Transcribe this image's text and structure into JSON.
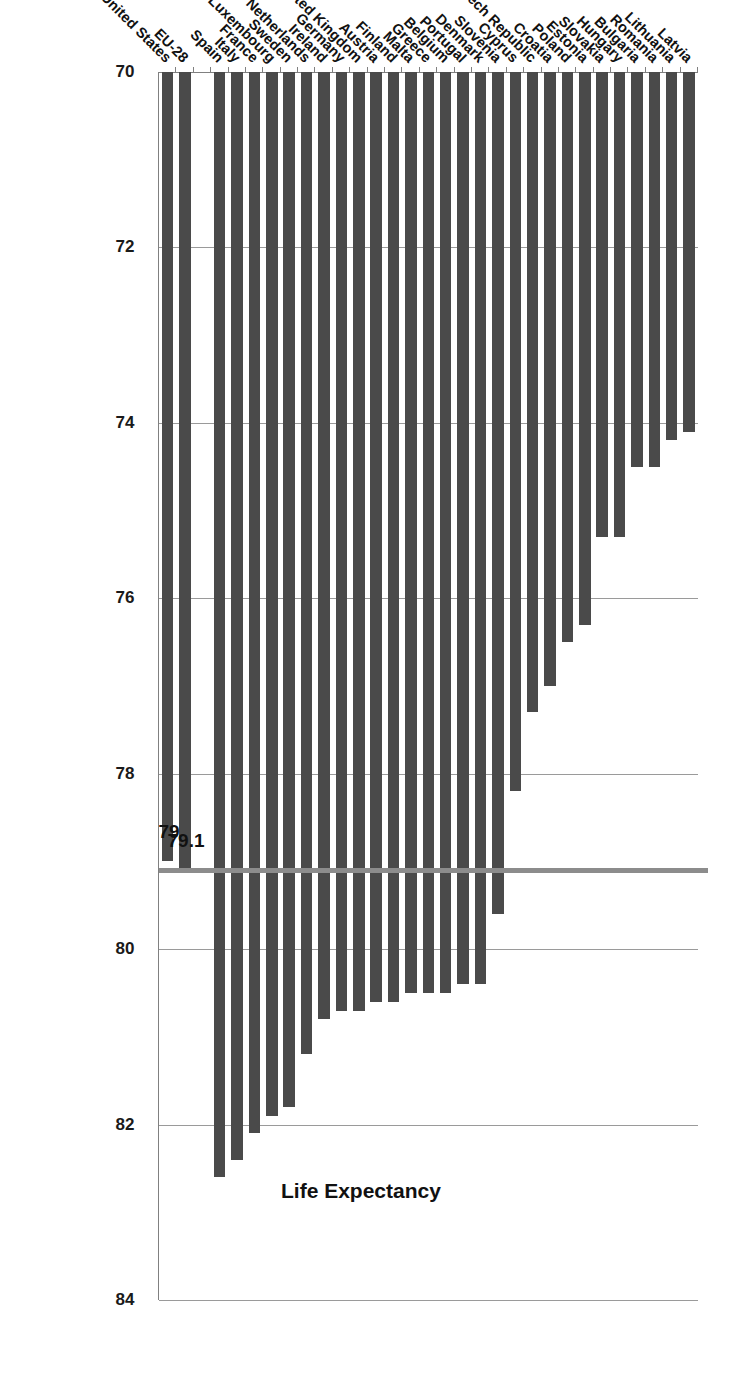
{
  "chart_data": {
    "type": "bar",
    "orientation": "horizontal",
    "title": "Life Expectancy",
    "xlabel": "",
    "ylabel": "",
    "xlim": [
      70,
      84
    ],
    "xticks": [
      70,
      72,
      74,
      76,
      78,
      80,
      82,
      84
    ],
    "xtick_labels": [
      "70",
      "72",
      "74",
      "76",
      "78",
      "80",
      "82",
      "84"
    ],
    "grid": true,
    "legend": null,
    "bar_color": "#4a4a4a",
    "reference_line": {
      "value": 79.1,
      "label": "79.1",
      "color": "#8c8c8c"
    },
    "annotations": [
      {
        "text": "79.1",
        "series": "EU-28"
      },
      {
        "text": "79",
        "series": "United States"
      }
    ],
    "categories": [
      "Latvia",
      "Lithuania",
      "Romania",
      "Bulgaria",
      "Hungary",
      "Slovakia",
      "Estonia",
      "Poland",
      "Croatia",
      "Czech Republic",
      "Cyprus",
      "Slovenia",
      "Denmark",
      "Portugal",
      "Belgium",
      "Greece",
      "Malta",
      "Finland",
      "Austria",
      "United Kingdom",
      "Germany",
      "Ireland",
      "Netherlands",
      "Sweden",
      "Luxembourg",
      "France",
      "Italy",
      "Spain",
      "",
      "EU-28",
      "United States"
    ],
    "values": [
      74.1,
      74.2,
      74.5,
      74.5,
      75.3,
      75.3,
      76.3,
      76.5,
      77.0,
      77.3,
      78.2,
      79.6,
      80.4,
      80.4,
      80.5,
      80.5,
      80.5,
      80.6,
      80.6,
      80.7,
      80.7,
      80.8,
      81.2,
      81.8,
      81.9,
      82.1,
      82.4,
      82.6,
      null,
      79.1,
      79.0
    ]
  },
  "figure": {
    "background": "#ffffff",
    "axis_color": "#808080",
    "grid_color": "#9a9a9a",
    "text_color": "#111111"
  }
}
